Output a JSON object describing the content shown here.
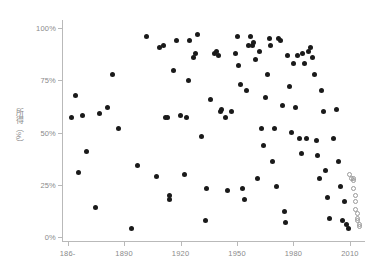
{
  "chart_data": {
    "type": "scatter",
    "title": "",
    "xlabel": "",
    "ylabel": "所得（%）",
    "xlim": [
      1857,
      2018
    ],
    "ylim": [
      -2,
      104
    ],
    "grid": false,
    "legend": false,
    "x_ticks": [
      1860,
      1890,
      1920,
      1950,
      1980,
      2010
    ],
    "x_tick_labels": [
      "186-",
      "1890",
      "1920",
      "1950",
      "1980",
      "2010"
    ],
    "y_ticks": [
      0,
      25,
      50,
      75,
      100
    ],
    "y_tick_labels": [
      "0%",
      "25%",
      "50%",
      "75%",
      "100%"
    ],
    "marker_colors": {
      "filled": "#1a1a1a",
      "open": "#9a9a9a"
    },
    "axis_color": "#b9b9b9",
    "label_color": "#8a8a8a",
    "series": [
      {
        "name": "observed",
        "marker": "filled-circle",
        "points": [
          [
            1862,
            57
          ],
          [
            1864,
            68
          ],
          [
            1866,
            31
          ],
          [
            1868,
            58
          ],
          [
            1870,
            41
          ],
          [
            1875,
            14
          ],
          [
            1877,
            59
          ],
          [
            1881,
            62
          ],
          [
            1884,
            78
          ],
          [
            1887,
            52
          ],
          [
            1894,
            4
          ],
          [
            1897,
            34
          ],
          [
            1902,
            96
          ],
          [
            1907,
            29
          ],
          [
            1909,
            91
          ],
          [
            1911,
            92
          ],
          [
            1912,
            57
          ],
          [
            1913,
            57
          ],
          [
            1914,
            18
          ],
          [
            1914,
            20
          ],
          [
            1916,
            80
          ],
          [
            1918,
            94
          ],
          [
            1920,
            58
          ],
          [
            1922,
            30
          ],
          [
            1923,
            57
          ],
          [
            1924,
            75
          ],
          [
            1925,
            94
          ],
          [
            1927,
            86
          ],
          [
            1928,
            88
          ],
          [
            1929,
            97
          ],
          [
            1931,
            48
          ],
          [
            1933,
            8
          ],
          [
            1934,
            23
          ],
          [
            1936,
            66
          ],
          [
            1938,
            88
          ],
          [
            1939,
            89
          ],
          [
            1940,
            87
          ],
          [
            1941,
            60
          ],
          [
            1942,
            61
          ],
          [
            1944,
            57
          ],
          [
            1945,
            22
          ],
          [
            1947,
            60
          ],
          [
            1949,
            88
          ],
          [
            1950,
            96
          ],
          [
            1951,
            82
          ],
          [
            1952,
            73
          ],
          [
            1953,
            23
          ],
          [
            1954,
            18
          ],
          [
            1955,
            70
          ],
          [
            1956,
            92
          ],
          [
            1957,
            96
          ],
          [
            1958,
            92
          ],
          [
            1959,
            93
          ],
          [
            1960,
            85
          ],
          [
            1961,
            28
          ],
          [
            1962,
            89
          ],
          [
            1963,
            52
          ],
          [
            1964,
            44
          ],
          [
            1965,
            67
          ],
          [
            1966,
            78
          ],
          [
            1967,
            95
          ],
          [
            1968,
            92
          ],
          [
            1969,
            36
          ],
          [
            1970,
            52
          ],
          [
            1971,
            24
          ],
          [
            1972,
            95
          ],
          [
            1973,
            94
          ],
          [
            1974,
            63
          ],
          [
            1975,
            12
          ],
          [
            1976,
            7
          ],
          [
            1977,
            87
          ],
          [
            1978,
            72
          ],
          [
            1979,
            50
          ],
          [
            1980,
            83
          ],
          [
            1981,
            62
          ],
          [
            1982,
            87
          ],
          [
            1983,
            47
          ],
          [
            1984,
            40
          ],
          [
            1985,
            88
          ],
          [
            1986,
            83
          ],
          [
            1987,
            47
          ],
          [
            1988,
            89
          ],
          [
            1989,
            91
          ],
          [
            1990,
            86
          ],
          [
            1991,
            78
          ],
          [
            1992,
            46
          ],
          [
            1993,
            39
          ],
          [
            1994,
            28
          ],
          [
            1995,
            70
          ],
          [
            1996,
            60
          ],
          [
            1997,
            32
          ],
          [
            1998,
            19
          ],
          [
            1999,
            9
          ],
          [
            2001,
            47
          ],
          [
            2003,
            61
          ],
          [
            2004,
            36
          ],
          [
            2005,
            24
          ],
          [
            2006,
            8
          ],
          [
            2007,
            17
          ],
          [
            2008,
            6
          ],
          [
            2009,
            4
          ]
        ]
      },
      {
        "name": "projected",
        "marker": "open-circle",
        "points": [
          [
            2010,
            30
          ],
          [
            2011,
            28
          ],
          [
            2012,
            28
          ],
          [
            2012,
            27
          ],
          [
            2012,
            23
          ],
          [
            2013,
            20
          ],
          [
            2013,
            17
          ],
          [
            2013,
            13
          ],
          [
            2014,
            11
          ],
          [
            2014,
            9
          ],
          [
            2014,
            8
          ],
          [
            2015,
            6
          ],
          [
            2015,
            5
          ]
        ]
      }
    ]
  }
}
